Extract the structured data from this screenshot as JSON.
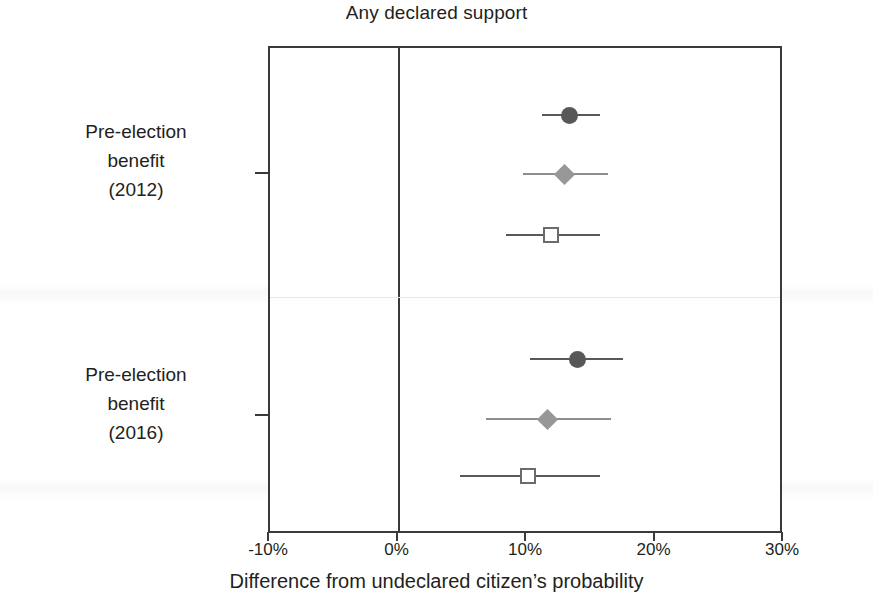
{
  "chart_data": {
    "type": "scatter",
    "title": "Any declared support",
    "xlabel": "Difference from undeclared citizen’s probability",
    "ylabel": "",
    "xlim": [
      -10,
      30
    ],
    "xticks": [
      -10,
      0,
      10,
      20,
      30
    ],
    "xticklabels": [
      "-10%",
      "0%",
      "10%",
      "20%",
      "30%"
    ],
    "grid": false,
    "legend": "none",
    "zero_reference_line": 0,
    "categories": [
      "Pre-election benefit (2012)",
      "Pre-election benefit (2016)"
    ],
    "category_lines": [
      [
        "Pre-election",
        "benefit",
        "(2012)"
      ],
      [
        "Pre-election",
        "benefit",
        "(2016)"
      ]
    ],
    "series": [
      {
        "name": "circle-estimate",
        "marker": "circle",
        "values": [
          13.3,
          13.9
        ],
        "ci_low": [
          11.2,
          10.2
        ],
        "ci_high": [
          15.7,
          17.5
        ],
        "color": "#585858"
      },
      {
        "name": "diamond-estimate",
        "marker": "diamond",
        "values": [
          12.9,
          11.6
        ],
        "ci_low": [
          9.7,
          6.8
        ],
        "ci_high": [
          16.3,
          16.5
        ],
        "color": "#979797"
      },
      {
        "name": "square-estimate",
        "marker": "square",
        "values": [
          11.9,
          10.1
        ],
        "ci_low": [
          8.4,
          4.8
        ],
        "ci_high": [
          15.7,
          15.7
        ],
        "color": "#6b6b6b"
      }
    ],
    "points": [
      {
        "group": 0,
        "marker": "circle",
        "estimate": 13.3,
        "ci_low": 11.2,
        "ci_high": 15.7
      },
      {
        "group": 0,
        "marker": "diamond",
        "estimate": 12.9,
        "ci_low": 9.7,
        "ci_high": 16.3
      },
      {
        "group": 0,
        "marker": "square",
        "estimate": 11.9,
        "ci_low": 8.4,
        "ci_high": 15.7
      },
      {
        "group": 1,
        "marker": "circle",
        "estimate": 13.9,
        "ci_low": 10.2,
        "ci_high": 17.5
      },
      {
        "group": 1,
        "marker": "diamond",
        "estimate": 11.6,
        "ci_low": 6.8,
        "ci_high": 16.5
      },
      {
        "group": 1,
        "marker": "square",
        "estimate": 10.1,
        "ci_low": 4.8,
        "ci_high": 15.7
      }
    ]
  },
  "axis": {
    "tick_labels": [
      "-10%",
      "0%",
      "10%",
      "20%",
      "30%"
    ],
    "x_title": "Difference from undeclared citizen’s probability"
  },
  "labels": {
    "group1_line1": "Pre-election",
    "group1_line2": "benefit",
    "group1_line3": "(2012)",
    "group2_line1": "Pre-election",
    "group2_line2": "benefit",
    "group2_line3": "(2016)"
  },
  "title": "Any declared support",
  "colors": {
    "axis": "#3a3a3a",
    "circle": "#585858",
    "diamond": "#979797",
    "square_outline": "#6b6b6b",
    "ci_line": "#6d6d6d",
    "separator": "#e7e7e7",
    "background": "#ffffff",
    "text": "#231f20"
  }
}
